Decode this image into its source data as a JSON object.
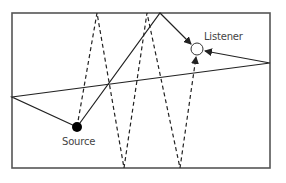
{
  "diagram": {
    "labels": {
      "source": "Source",
      "listener": "Listener"
    },
    "colors": {
      "line": "#222222",
      "wall": "#555555",
      "source_fill": "#000000",
      "listener_fill": "#ffffff"
    },
    "room": {
      "x": 12,
      "y": 13,
      "width": 258,
      "height": 155
    },
    "source": {
      "x": 77,
      "y": 127,
      "r": 5
    },
    "listener": {
      "x": 197,
      "y": 49,
      "r": 6
    },
    "paths": [
      {
        "name": "solid-ceiling-reflection",
        "style": "solid",
        "points": [
          [
            77,
            127
          ],
          [
            160,
            13
          ],
          [
            191,
            44
          ]
        ],
        "arrow_end": true
      },
      {
        "name": "solid-two-wall-reflection",
        "style": "solid",
        "points": [
          [
            77,
            127
          ],
          [
            12,
            97
          ],
          [
            270,
            63
          ],
          [
            205,
            51
          ]
        ],
        "arrow_end": true
      },
      {
        "name": "dashed-multi-reflection",
        "style": "dashed",
        "points": [
          [
            77,
            127
          ],
          [
            97,
            13
          ],
          [
            124,
            168
          ],
          [
            147,
            13
          ],
          [
            180,
            168
          ],
          [
            196,
            57
          ]
        ],
        "arrow_end": true
      }
    ]
  }
}
